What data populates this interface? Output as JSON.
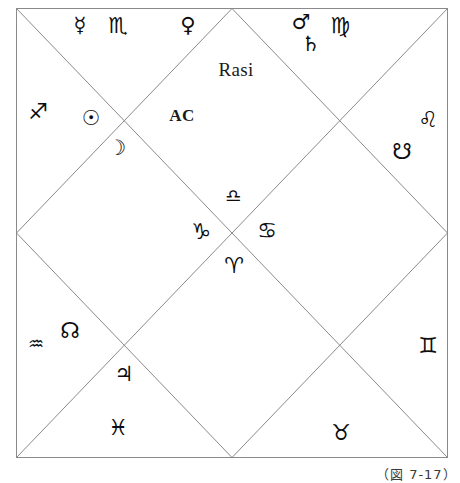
{
  "chart": {
    "title": "Rasi",
    "ascendant_label": "AC",
    "caption": "（図 7-17）",
    "frame": {
      "left": 16,
      "top": 8,
      "right": 448,
      "bottom": 458,
      "stroke_color": "#8a8a8a",
      "stroke_width": 1
    },
    "style": "north-indian-diagonal-square"
  },
  "signs": [
    {
      "name": "scorpio",
      "symbol": "♏",
      "x": 118,
      "y": 26
    },
    {
      "name": "virgo",
      "symbol": "♍",
      "x": 340,
      "y": 26
    },
    {
      "name": "sagittarius",
      "symbol": "♐",
      "x": 38,
      "y": 112
    },
    {
      "name": "leo",
      "symbol": "♌",
      "x": 428,
      "y": 120
    },
    {
      "name": "libra",
      "symbol": "♎",
      "x": 233,
      "y": 196
    },
    {
      "name": "capricorn",
      "symbol": "♑",
      "x": 201,
      "y": 232
    },
    {
      "name": "cancer",
      "symbol": "♋",
      "x": 267,
      "y": 231
    },
    {
      "name": "aries",
      "symbol": "♈",
      "x": 234,
      "y": 266
    },
    {
      "name": "aquarius",
      "symbol": "♒",
      "x": 36,
      "y": 344
    },
    {
      "name": "gemini",
      "symbol": "♊",
      "x": 428,
      "y": 346
    },
    {
      "name": "pisces",
      "symbol": "♓",
      "x": 118,
      "y": 428
    },
    {
      "name": "taurus",
      "symbol": "♉",
      "x": 341,
      "y": 433
    }
  ],
  "planets": [
    {
      "name": "mercury",
      "symbol": "☿",
      "x": 80,
      "y": 25
    },
    {
      "name": "venus",
      "symbol": "♀",
      "x": 188,
      "y": 25
    },
    {
      "name": "mars",
      "symbol": "♂",
      "x": 301,
      "y": 22
    },
    {
      "name": "saturn",
      "symbol": "♄",
      "x": 311,
      "y": 44
    },
    {
      "name": "sun",
      "symbol": "☉",
      "x": 91,
      "y": 118
    },
    {
      "name": "moon",
      "symbol": "☽",
      "x": 117,
      "y": 148
    },
    {
      "name": "jupiter",
      "symbol": "♃",
      "x": 124,
      "y": 374
    }
  ],
  "nodes": [
    {
      "name": "ketu-descending-node",
      "symbol": "☋",
      "x": 402,
      "y": 152
    },
    {
      "name": "rahu-ascending-node",
      "symbol": "☊",
      "x": 70,
      "y": 331
    }
  ],
  "labels": {
    "title": {
      "x": 236,
      "y": 70
    },
    "ascendant": {
      "x": 182,
      "y": 116
    }
  }
}
